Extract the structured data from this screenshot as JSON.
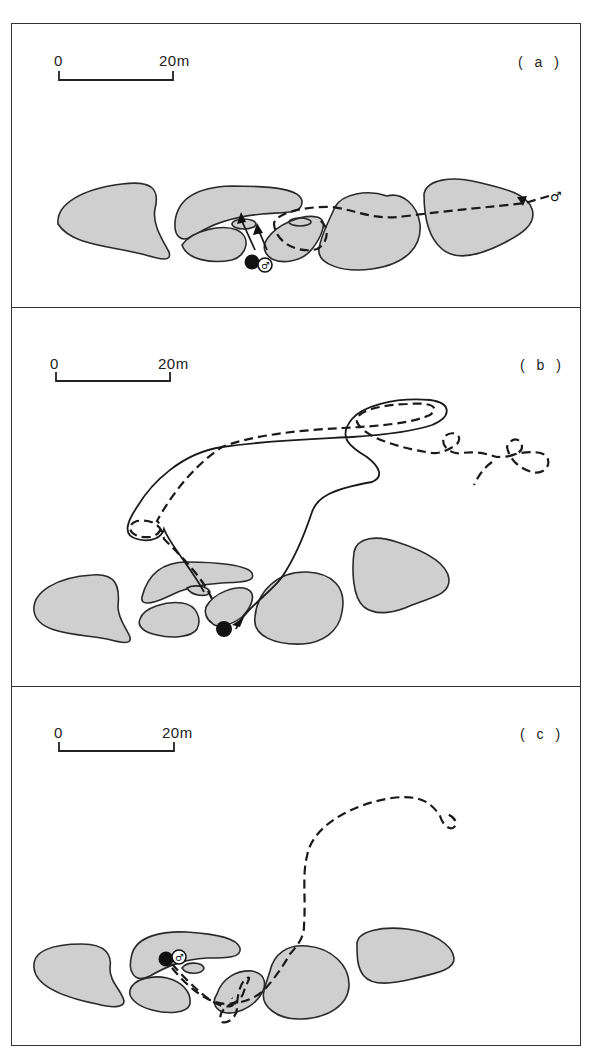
{
  "figure": {
    "panels": [
      {
        "id": "a",
        "label": "( a )",
        "scale": {
          "zero": "0",
          "end": "20m"
        },
        "male_symbol": "♂"
      },
      {
        "id": "b",
        "label": "( b )",
        "scale": {
          "zero": "0",
          "end": "20m"
        }
      },
      {
        "id": "c",
        "label": "( c )",
        "scale": {
          "zero": "0",
          "end": "20m"
        },
        "male_symbol": "♂"
      }
    ],
    "legend_semantics": {
      "filled_circle": "female",
      "open_circle_male": "male",
      "dashed_line": "male path",
      "solid_line": "female path",
      "grey_shapes": "rocks/cover patches"
    },
    "colors": {
      "rock_fill": "#cfcfcf",
      "stroke": "#1a1a1a",
      "background": "#ffffff"
    }
  }
}
